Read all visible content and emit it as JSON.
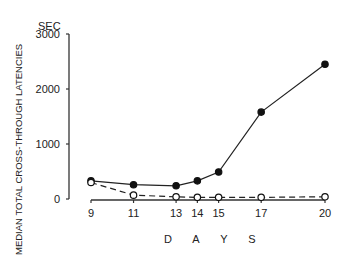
{
  "chart_data": {
    "type": "line",
    "title": "",
    "unit_label": "SEC",
    "xlabel": "D A Y S",
    "ylabel": "MEDIAN TOTAL CROSS-THROUGH LATENCIES",
    "x": [
      9,
      11,
      13,
      14,
      15,
      17,
      20
    ],
    "x_tick_labels": [
      "9",
      "11",
      "13",
      "14",
      "15",
      "17",
      "20"
    ],
    "y_tick_labels": [
      "0",
      "1000",
      "2000",
      "3000"
    ],
    "ylim": [
      0,
      3000
    ],
    "grid": false,
    "legend": null,
    "series": [
      {
        "name": "filled-circles-solid",
        "marker": "filled circle",
        "line": "solid",
        "values": [
          330,
          260,
          240,
          330,
          490,
          1580,
          2450
        ]
      },
      {
        "name": "open-circles-dashed",
        "marker": "open circle",
        "line": "dashed",
        "values": [
          300,
          70,
          40,
          30,
          30,
          30,
          40
        ]
      }
    ]
  }
}
